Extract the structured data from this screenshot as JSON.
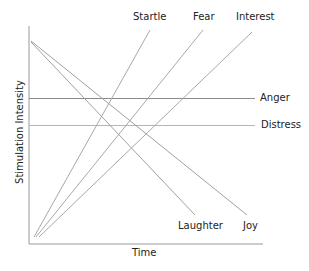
{
  "diagram": {
    "axes": {
      "x_label": "Time",
      "y_label": "Stimulation Intensity"
    },
    "rising_lines": [
      {
        "label": "Startle"
      },
      {
        "label": "Fear"
      },
      {
        "label": "Interest"
      }
    ],
    "flat_lines": [
      {
        "label": "Anger"
      },
      {
        "label": "Distress"
      }
    ],
    "falling_lines": [
      {
        "label": "Laughter"
      },
      {
        "label": "Joy"
      }
    ],
    "colors": {
      "axis": "#9a9a9a",
      "line": "#a8a8a8",
      "text": "#222222"
    }
  }
}
